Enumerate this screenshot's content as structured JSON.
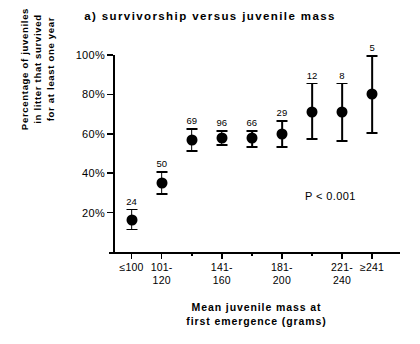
{
  "chart_data": {
    "type": "scatter",
    "title": "a)  survivorship  versus  juvenile  mass",
    "xlabel": "Mean  juvenile  mass  at\nfirst  emergence  (grams)",
    "ylabel": "Percentage  of  juveniles\nin  litter  that  survived\nfor  at  least  one  year",
    "annotation": "P < 0.001",
    "ylim": [
      0,
      100
    ],
    "yticks": [
      20,
      40,
      60,
      80,
      100
    ],
    "ytick_labels": [
      "20%",
      "40%",
      "60%",
      "80%",
      "100%"
    ],
    "grid": false,
    "legend": false,
    "categories": [
      "≤100",
      "101-\n120",
      "121-\n140",
      "141-\n160",
      "161-\n180",
      "181-\n200",
      "201-\n220",
      "221-\n240",
      "≥241"
    ],
    "category_labels_shown": [
      "≤100",
      "101-\n120",
      "",
      "141-\n160",
      "",
      "181-\n200",
      "",
      "221-\n240",
      "≥241"
    ],
    "values": [
      16,
      35,
      57,
      58,
      58,
      60,
      71,
      71,
      80
    ],
    "error_low": [
      11,
      29,
      51,
      54,
      53,
      53,
      57,
      56,
      60
    ],
    "error_high": [
      22,
      41,
      63,
      62,
      62,
      67,
      86,
      86,
      100
    ],
    "point_labels": [
      "24",
      "50",
      "69",
      "96",
      "66",
      "29",
      "12",
      "8",
      "5"
    ],
    "point_label_meaning": "sample size (n)",
    "marker_color": "#000000"
  }
}
